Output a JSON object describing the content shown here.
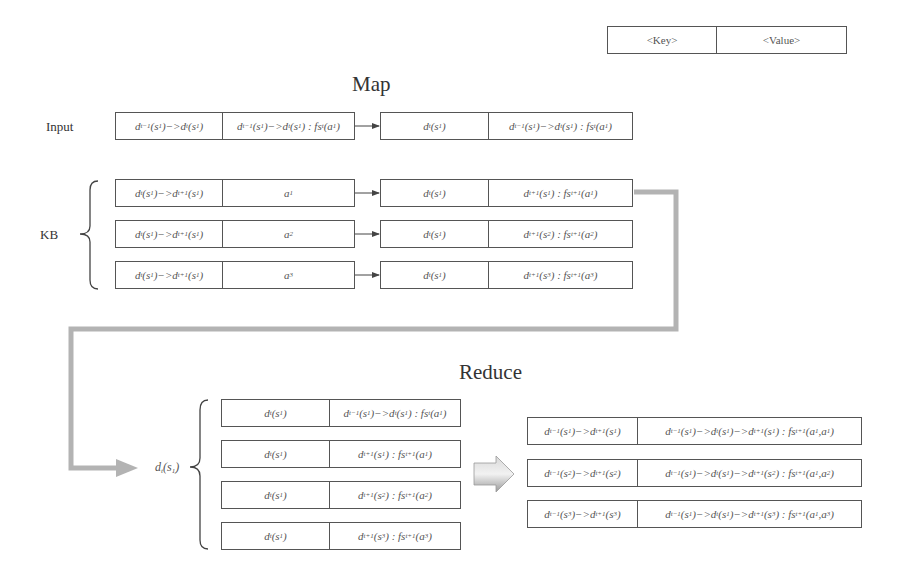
{
  "legend": {
    "key": "<Key>",
    "value": "<Value>"
  },
  "map": {
    "title": "Map",
    "input_label": "Input",
    "input_row": {
      "key": "d_{t-1}(s_1)->d_t(s_1)",
      "value": "d_{t-1}(s_1)->d_t(s_1) : fs_t(a_1)",
      "out_key": "d_t(s_1)",
      "out_value": "d_{t-1}(s_1)->d_t(s_1) : fs_t(a_1)"
    },
    "kb_label": "KB",
    "kb_rows": [
      {
        "key": "d_t(s_1)->d_{t+1}(s_1)",
        "value": "a_1",
        "out_key": "d_t(s_1)",
        "out_value": "d_{t+1}(s_1) : fs_{t+1}(a_1)"
      },
      {
        "key": "d_t(s_1)->d_{t+1}(s_1)",
        "value": "a_2",
        "out_key": "d_t(s_1)",
        "out_value": "d_{t+1}(s_2) : fs_{t+1}(a_2)"
      },
      {
        "key": "d_t(s_1)->d_{t+1}(s_1)",
        "value": "a_3",
        "out_key": "d_t(s_1)",
        "out_value": "d_{t+1}(s_3) : fs_{t+1}(a_3)"
      }
    ]
  },
  "reduce": {
    "title": "Reduce",
    "group_label": "d_t(s_1)",
    "group_rows": [
      {
        "key": "d_t(s_1)",
        "value": "d_{t-1}(s_1)->d_t(s_1) : fs_t(a_1)"
      },
      {
        "key": "d_t(s_1)",
        "value": "d_{t+1}(s_1) : fs_{t+1}(a_1)"
      },
      {
        "key": "d_t(s_1)",
        "value": "d_{t+1}(s_2) : fs_{t+1}(a_2)"
      },
      {
        "key": "d_t(s_1)",
        "value": "d_{t+1}(s_3) : fs_{t+1}(a_3)"
      }
    ],
    "output_rows": [
      {
        "key": "d_{t-1}(s_1)->d_{t+1}(s_1)",
        "value": "d_{t-1}(s_1)->d_t(s_1)->d_{t+1}(s_1) : fs_{t+1}(a_1,a_1)"
      },
      {
        "key": "d_{t-1}(s_2)->d_{t+1}(s_2)",
        "value": "d_{t-1}(s_1)->d_t(s_1)->d_{t+1}(s_2) : fs_{t+1}(a_1,a_2)"
      },
      {
        "key": "d_{t-1}(s_3)->d_{t+1}(s_3)",
        "value": "d_{t-1}(s_1)->d_t(s_1)->d_{t+1}(s_3) : fs_{t+1}(a_1,a_3)"
      }
    ]
  },
  "colors": {
    "border": "#555555",
    "flow_arrow": "#b3b3b3",
    "text": "#333333"
  }
}
